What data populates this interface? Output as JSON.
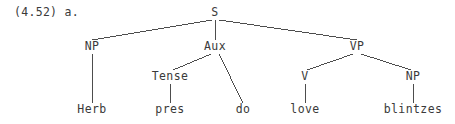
{
  "figure": {
    "example_label": "(4.52) a.",
    "type": "syntax-tree",
    "sentence": "Herb pres do love blintzes",
    "ink_color": "#3a3a3a",
    "background_color": "#ffffff"
  },
  "tree": {
    "nodes": [
      {
        "id": "S",
        "label": "S",
        "x": 215,
        "y": 13,
        "kind": "nonterminal"
      },
      {
        "id": "NP1",
        "label": "NP",
        "x": 92,
        "y": 47,
        "kind": "nonterminal"
      },
      {
        "id": "Aux",
        "label": "Aux",
        "x": 215,
        "y": 47,
        "kind": "nonterminal"
      },
      {
        "id": "VP",
        "label": "VP",
        "x": 357,
        "y": 47,
        "kind": "nonterminal"
      },
      {
        "id": "Tense",
        "label": "Tense",
        "x": 170,
        "y": 77,
        "kind": "nonterminal"
      },
      {
        "id": "V",
        "label": "V",
        "x": 305,
        "y": 77,
        "kind": "nonterminal"
      },
      {
        "id": "NP2",
        "label": "NP",
        "x": 413,
        "y": 77,
        "kind": "nonterminal"
      },
      {
        "id": "Herb",
        "label": "Herb",
        "x": 92,
        "y": 110,
        "kind": "terminal"
      },
      {
        "id": "pres",
        "label": "pres",
        "x": 170,
        "y": 110,
        "kind": "terminal"
      },
      {
        "id": "do",
        "label": "do",
        "x": 243,
        "y": 110,
        "kind": "terminal"
      },
      {
        "id": "love",
        "label": "love",
        "x": 305,
        "y": 110,
        "kind": "terminal"
      },
      {
        "id": "blintzes",
        "label": "blintzes",
        "x": 413,
        "y": 110,
        "kind": "terminal"
      }
    ],
    "edges": [
      {
        "from": "S",
        "to": "NP1",
        "x1": 212,
        "y1": 20,
        "x2": 92,
        "y2": 40
      },
      {
        "from": "S",
        "to": "Aux",
        "x1": 215,
        "y1": 20,
        "x2": 215,
        "y2": 40
      },
      {
        "from": "S",
        "to": "VP",
        "x1": 219,
        "y1": 20,
        "x2": 357,
        "y2": 40
      },
      {
        "from": "NP1",
        "to": "Herb",
        "x1": 92,
        "y1": 54,
        "x2": 92,
        "y2": 103
      },
      {
        "from": "Aux",
        "to": "Tense",
        "x1": 211,
        "y1": 54,
        "x2": 173,
        "y2": 70
      },
      {
        "from": "Aux",
        "to": "do",
        "x1": 219,
        "y1": 54,
        "x2": 243,
        "y2": 103
      },
      {
        "from": "Tense",
        "to": "pres",
        "x1": 170,
        "y1": 84,
        "x2": 170,
        "y2": 103
      },
      {
        "from": "VP",
        "to": "V",
        "x1": 353,
        "y1": 54,
        "x2": 307,
        "y2": 70
      },
      {
        "from": "VP",
        "to": "NP2",
        "x1": 361,
        "y1": 54,
        "x2": 411,
        "y2": 70
      },
      {
        "from": "V",
        "to": "love",
        "x1": 305,
        "y1": 84,
        "x2": 305,
        "y2": 103
      },
      {
        "from": "NP2",
        "to": "blintzes",
        "x1": 413,
        "y1": 84,
        "x2": 413,
        "y2": 103
      }
    ]
  }
}
